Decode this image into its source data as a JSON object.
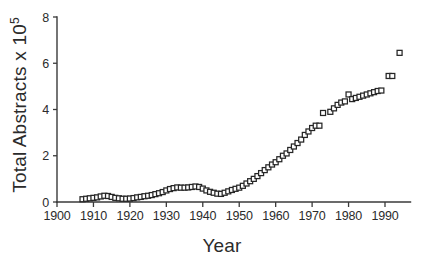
{
  "figure": {
    "width": 424,
    "height": 261,
    "background": "#ffffff",
    "ink_color": "#262626"
  },
  "chart_data": {
    "type": "scatter",
    "title": "",
    "subtitle": "",
    "xlabel": "Year",
    "ylabel": "Total Abstracts x 10",
    "ylabel_exponent": "5",
    "ylabel_full": "Total Abstracts x 10⁵",
    "xlim": [
      1900,
      1997
    ],
    "ylim": [
      0,
      8
    ],
    "xticks": [
      1900,
      1910,
      1920,
      1930,
      1940,
      1950,
      1960,
      1970,
      1980,
      1990
    ],
    "yticks": [
      0,
      2,
      4,
      6,
      8
    ],
    "xtick_labels": [
      "1900",
      "1910",
      "1920",
      "1930",
      "1940",
      "1950",
      "1960",
      "1970",
      "1980",
      "1990"
    ],
    "ytick_labels": [
      "0",
      "2",
      "4",
      "6",
      "8"
    ],
    "grid": false,
    "legend": null,
    "legend_position": "none",
    "marker": "open-square",
    "marker_size": 5,
    "marker_fill": "#ffffff",
    "marker_stroke": "#262626",
    "series": [
      {
        "name": "Total Abstracts",
        "x": [
          1907,
          1908,
          1909,
          1910,
          1911,
          1912,
          1913,
          1914,
          1915,
          1916,
          1917,
          1918,
          1919,
          1920,
          1921,
          1922,
          1923,
          1924,
          1925,
          1926,
          1927,
          1928,
          1929,
          1930,
          1931,
          1932,
          1933,
          1934,
          1935,
          1936,
          1937,
          1938,
          1939,
          1940,
          1941,
          1942,
          1943,
          1944,
          1945,
          1946,
          1947,
          1948,
          1949,
          1950,
          1951,
          1952,
          1953,
          1954,
          1955,
          1956,
          1957,
          1958,
          1959,
          1960,
          1961,
          1962,
          1963,
          1964,
          1965,
          1966,
          1967,
          1968,
          1969,
          1970,
          1971,
          1972,
          1973,
          1975,
          1976,
          1977,
          1978,
          1979,
          1980,
          1981,
          1982,
          1983,
          1984,
          1985,
          1986,
          1987,
          1988,
          1989,
          1991,
          1992,
          1994
        ],
        "y": [
          0.12,
          0.14,
          0.16,
          0.18,
          0.2,
          0.24,
          0.27,
          0.26,
          0.22,
          0.18,
          0.16,
          0.14,
          0.14,
          0.15,
          0.17,
          0.2,
          0.22,
          0.25,
          0.27,
          0.3,
          0.34,
          0.38,
          0.43,
          0.5,
          0.56,
          0.6,
          0.63,
          0.62,
          0.62,
          0.63,
          0.65,
          0.67,
          0.65,
          0.58,
          0.5,
          0.44,
          0.4,
          0.36,
          0.35,
          0.4,
          0.46,
          0.52,
          0.57,
          0.62,
          0.7,
          0.8,
          0.9,
          1.0,
          1.12,
          1.25,
          1.38,
          1.5,
          1.62,
          1.72,
          1.85,
          2.0,
          2.1,
          2.25,
          2.4,
          2.55,
          2.7,
          2.9,
          3.05,
          3.2,
          3.3,
          3.3,
          3.85,
          3.9,
          4.05,
          4.2,
          4.3,
          4.35,
          4.65,
          4.45,
          4.5,
          4.55,
          4.6,
          4.65,
          4.7,
          4.75,
          4.8,
          4.82,
          5.45,
          5.45,
          6.45
        ]
      }
    ]
  }
}
